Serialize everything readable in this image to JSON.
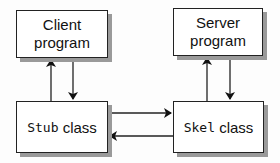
{
  "diagram": {
    "nodes": [
      {
        "id": "client",
        "line1": "Client",
        "line2": "program"
      },
      {
        "id": "server",
        "line1": "Server",
        "line2": "program"
      },
      {
        "id": "stub",
        "code": "Stub",
        "text": " class"
      },
      {
        "id": "skel",
        "code": "Skel",
        "text": " class"
      }
    ],
    "edges": [
      {
        "from": "stub",
        "to": "client"
      },
      {
        "from": "client",
        "to": "stub"
      },
      {
        "from": "stub",
        "to": "skel"
      },
      {
        "from": "skel",
        "to": "stub"
      },
      {
        "from": "skel",
        "to": "server"
      },
      {
        "from": "server",
        "to": "skel"
      }
    ]
  }
}
